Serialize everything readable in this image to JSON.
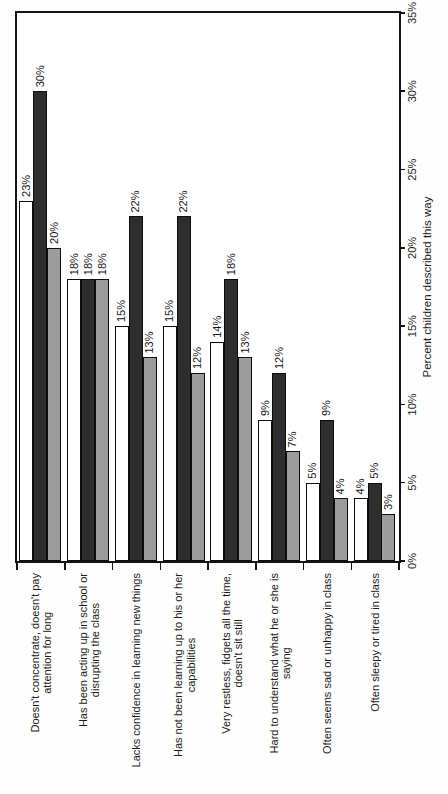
{
  "chart_data": {
    "type": "bar",
    "orientation": "horizontal",
    "page_rotated_90deg": true,
    "title": "",
    "grid": false,
    "legend": false,
    "categories": [
      {
        "lines": [
          "Doesn't concentrate, doesn't pay",
          "attention for long"
        ]
      },
      {
        "lines": [
          "Has been acting up in school or",
          "disrupting the class"
        ]
      },
      {
        "lines": [
          "Lacks confidence in learning new things"
        ]
      },
      {
        "lines": [
          "Has not been learning up to his or her",
          "capabilities"
        ]
      },
      {
        "lines": [
          "Very restless, fidgets all the time,",
          "doesn't sit still"
        ]
      },
      {
        "lines": [
          "Hard to understand what he or she is",
          "saying"
        ]
      },
      {
        "lines": [
          "Often seems sad or unhappy in class"
        ]
      },
      {
        "lines": [
          "Often sleepy or tired in class"
        ]
      }
    ],
    "series": [
      {
        "name": "white",
        "color": "#ffffff",
        "values": [
          23,
          18,
          15,
          15,
          14,
          9,
          5,
          4
        ],
        "labels": [
          "23%",
          "18%",
          "15%",
          "15%",
          "14%",
          "9%",
          "5%",
          "4%"
        ]
      },
      {
        "name": "dark",
        "color": "#2e2e2e",
        "values": [
          30,
          18,
          22,
          22,
          18,
          12,
          9,
          5
        ],
        "labels": [
          "30%",
          "18%",
          "22%",
          "22%",
          "18%",
          "12%",
          "9%",
          "5%"
        ]
      },
      {
        "name": "gray",
        "color": "#9d9d9d",
        "values": [
          20,
          18,
          13,
          12,
          13,
          7,
          4,
          3
        ],
        "labels": [
          "20%",
          "18%",
          "13%",
          "12%",
          "13%",
          "7%",
          "4%",
          "3%"
        ]
      }
    ],
    "value_axis": {
      "min": 0,
      "max": 35,
      "tick_step": 5,
      "title": "Percent children described this way",
      "ticks": [
        {
          "value": 0,
          "label": "0%"
        },
        {
          "value": 5,
          "label": "5%"
        },
        {
          "value": 10,
          "label": "10%"
        },
        {
          "value": 15,
          "label": "15%"
        },
        {
          "value": 20,
          "label": "20%"
        },
        {
          "value": 25,
          "label": "25%"
        },
        {
          "value": 30,
          "label": "30%"
        },
        {
          "value": 35,
          "label": "35%"
        }
      ]
    },
    "colors": {
      "bar_outline": "#0d0d0d",
      "plot_border": "#141414",
      "text": "#1c1c1c"
    }
  }
}
